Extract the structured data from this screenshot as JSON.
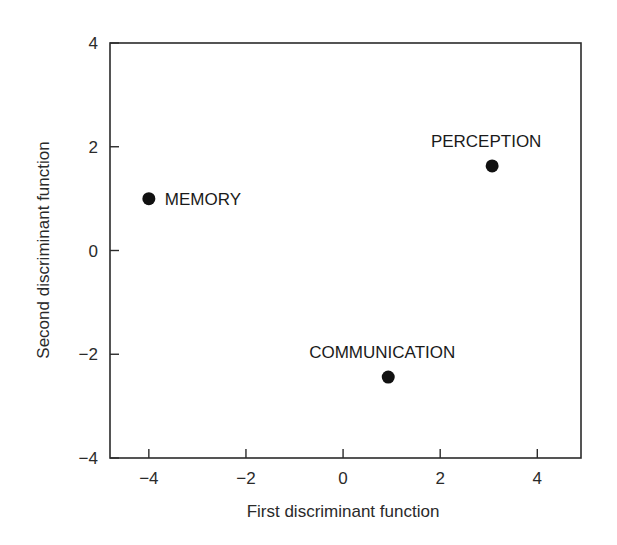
{
  "chart_data": {
    "type": "scatter",
    "title": "",
    "xlabel": "First discriminant function",
    "ylabel": "Second discriminant function",
    "xlim": [
      -4.8,
      4.9
    ],
    "ylim": [
      -4,
      4
    ],
    "xticks": [
      -4,
      -2,
      0,
      2,
      4
    ],
    "xtick_labels": [
      "−4",
      "−2",
      "0",
      "2",
      "4"
    ],
    "yticks": [
      -4,
      -2,
      0,
      2,
      4
    ],
    "ytick_labels": [
      "−4",
      "−2",
      "0",
      "2",
      "4"
    ],
    "grid": false,
    "legend": null,
    "points": [
      {
        "label": "MEMORY",
        "x": -4.0,
        "y": 1.0,
        "label_position": "right"
      },
      {
        "label": "PERCEPTION",
        "x": 3.07,
        "y": 1.63,
        "label_position": "above"
      },
      {
        "label": "COMMUNICATION",
        "x": 0.93,
        "y": -2.44,
        "label_position": "above"
      }
    ],
    "marker_color": "#111111"
  }
}
